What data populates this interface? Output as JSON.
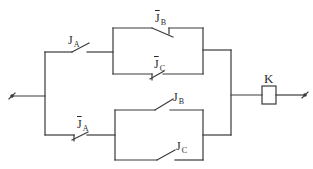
{
  "diagram": {
    "type": "relay-contact-circuit",
    "contacts": [
      {
        "id": "JA",
        "label": "J",
        "sub": "A",
        "negated": false,
        "kind": "normally-open"
      },
      {
        "id": "JB_bar",
        "label": "J",
        "sub": "B",
        "negated": true,
        "kind": "normally-closed"
      },
      {
        "id": "JC_bar",
        "label": "J",
        "sub": "C",
        "negated": true,
        "kind": "normally-closed"
      },
      {
        "id": "JA_bar",
        "label": "J",
        "sub": "A",
        "negated": true,
        "kind": "normally-closed"
      },
      {
        "id": "JB",
        "label": "J",
        "sub": "B",
        "negated": false,
        "kind": "normally-open"
      },
      {
        "id": "JC",
        "label": "J",
        "sub": "C",
        "negated": false,
        "kind": "normally-open"
      }
    ],
    "coil": {
      "label": "K"
    },
    "colors": {
      "line": "#3a3a3a",
      "background": "#ffffff"
    }
  }
}
